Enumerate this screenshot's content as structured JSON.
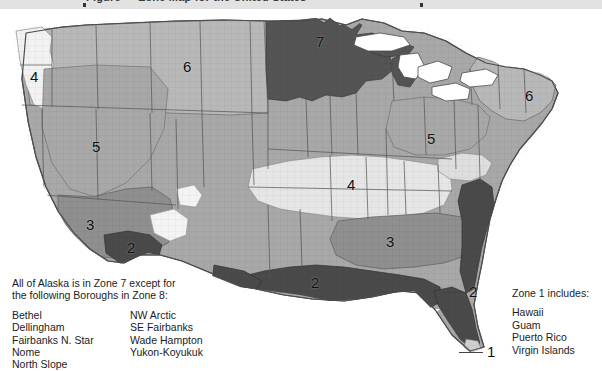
{
  "page": {
    "top_banner_clipped_text": "Figure  —  Zone Map for the United States"
  },
  "map": {
    "name": "united-states-zone-map",
    "zone_labels": [
      {
        "id": "zone-4-pacific-northwest",
        "text": "4",
        "x": 30,
        "y": 68,
        "region": "Pacific Northwest"
      },
      {
        "id": "zone-6-northern-rockies",
        "text": "6",
        "x": 183,
        "y": 58,
        "region": "Northern Rockies / Plains"
      },
      {
        "id": "zone-7-upper-midwest",
        "text": "7",
        "x": 316,
        "y": 33,
        "region": "Upper Midwest"
      },
      {
        "id": "zone-5-great-basin",
        "text": "5",
        "x": 92,
        "y": 138,
        "region": "Great Basin"
      },
      {
        "id": "zone-5-ohio-valley",
        "text": "5",
        "x": 427,
        "y": 130,
        "region": "Ohio Valley"
      },
      {
        "id": "zone-6-new-england",
        "text": "6",
        "x": 525,
        "y": 87,
        "region": "New England"
      },
      {
        "id": "zone-4-central-plains",
        "text": "4",
        "x": 347,
        "y": 176,
        "region": "Central Plains"
      },
      {
        "id": "zone-3-southwest",
        "text": "3",
        "x": 86,
        "y": 216,
        "region": "Southwest"
      },
      {
        "id": "zone-3-southeast",
        "text": "3",
        "x": 386,
        "y": 233,
        "region": "Southeast"
      },
      {
        "id": "zone-2-southern-arizona",
        "text": "2",
        "x": 127,
        "y": 239,
        "region": "Southern Arizona"
      },
      {
        "id": "zone-2-gulf-coast",
        "text": "2",
        "x": 311,
        "y": 274,
        "region": "Gulf Coast"
      },
      {
        "id": "zone-2-florida-atlantic",
        "text": "2",
        "x": 469,
        "y": 283,
        "region": "Florida Atlantic Coast"
      },
      {
        "id": "zone-1-florida-keys",
        "text": "1",
        "x": 487,
        "y": 343,
        "region": "Florida Keys"
      }
    ],
    "leaders": [
      {
        "id": "leader-zone-2-florida",
        "x": 443,
        "y": 288,
        "width": 23
      },
      {
        "id": "leader-zone-1-keys",
        "x": 459,
        "y": 348,
        "width": 24
      }
    ]
  },
  "legend_left": {
    "name": "alaska-note",
    "lead_line_1": "All of Alaska is in Zone 7 except for",
    "lead_line_2": "the following Boroughs in Zone 8:",
    "boroughs_column_1": [
      "Bethel",
      "Dellingham",
      "Fairbanks N. Star",
      "Nome",
      "North Slope"
    ],
    "boroughs_column_2": [
      "NW Arctic",
      "SE Fairbanks",
      "Wade Hampton",
      "Yukon-Koyukuk"
    ]
  },
  "legend_right": {
    "name": "zone-1-note",
    "title": "Zone 1 includes:",
    "items": [
      "Hawaii",
      "Guam",
      "Puerto Rico",
      "Virgin Islands"
    ]
  },
  "colors": {
    "zone_1_lightest": "#f4f4f4",
    "zone_2_darkest": "#4a4a4a",
    "zone_3_mid_dark": "#8f8f8f",
    "zone_4_light": "#e4e4e4",
    "zone_5_mid": "#a8a8a8",
    "zone_6_mid_light": "#b8b8b8",
    "zone_7_dark": "#545454",
    "outline": "#4d4d4d",
    "background": "#ffffff",
    "banner": "#e2e2e2",
    "text": "#1c1c1c"
  }
}
